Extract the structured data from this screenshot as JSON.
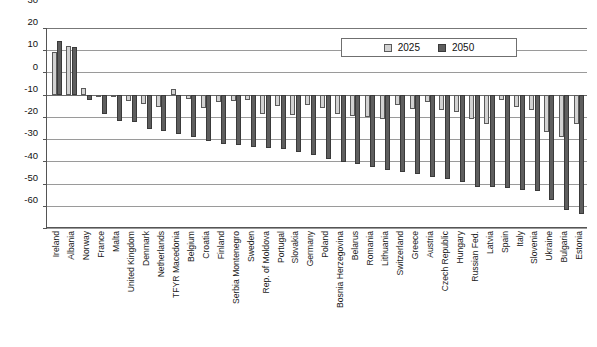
{
  "chart_data": {
    "type": "bar",
    "title": "",
    "subtitle": "",
    "xlabel": "",
    "ylabel": "",
    "ylim": [
      -60,
      30
    ],
    "yticks": [
      30,
      20,
      10,
      0,
      -10,
      -20,
      -30,
      -40,
      -50,
      -60
    ],
    "ytick_labels": [
      "30",
      "20",
      "10",
      "0",
      "-10",
      "-20",
      "-30",
      "-40",
      "-50",
      "-60"
    ],
    "grid": true,
    "legend_position": "top-right-inside",
    "categories": [
      "Ireland",
      "Albania",
      "Norway",
      "France",
      "Malta",
      "United Kingdom",
      "Denmark",
      "Netherlands",
      "TFYR Macedonia",
      "Belgium",
      "Croatia",
      "Finland",
      "Serbia Montenegro",
      "Sweden",
      "Rep. of Moldova",
      "Portugal",
      "Slovakia",
      "Germany",
      "Poland",
      "Bosnia Herzegovina",
      "Belarus",
      "Romania",
      "Lithuania",
      "Switzerland",
      "Greece",
      "Austria",
      "Czech Republic",
      "Hungary",
      "Russian Fed.",
      "Latvia",
      "Spain",
      "Italy",
      "Slovenia",
      "Ukraine",
      "Bulgaria",
      "Estonia"
    ],
    "series": [
      {
        "name": "2025",
        "color": "#d2d2d2",
        "values": [
          19,
          22,
          3,
          -1,
          -0.5,
          -3,
          -4,
          -5.5,
          2.5,
          -2,
          -6,
          -3.5,
          -3,
          -2.5,
          -8.5,
          -5,
          -9,
          -4.5,
          -6,
          -8.5,
          -9.5,
          -10,
          -11,
          -4.5,
          -6.5,
          -3.5,
          -7,
          -8,
          -11,
          -13,
          -2.5,
          -5.5,
          -7,
          -17,
          -19,
          -13
        ]
      },
      {
        "name": "2050",
        "color": "#5e5e5e",
        "values": [
          24,
          21.5,
          -2.5,
          -8.5,
          -12,
          -12.5,
          -15.5,
          -16.5,
          -17.5,
          -19,
          -21,
          -22,
          -22.5,
          -23.5,
          -24,
          -24.5,
          -26,
          -27,
          -29,
          -30.5,
          -31,
          -32.5,
          -34,
          -35,
          -35.5,
          -37,
          -38,
          -39.5,
          -41.5,
          -41.5,
          -42,
          -43,
          -43.5,
          -47.5,
          -52,
          -53.5
        ]
      }
    ],
    "legend": [
      "2025",
      "2050"
    ]
  },
  "legend": {
    "items": [
      {
        "label": "2025"
      },
      {
        "label": "2050"
      }
    ]
  }
}
